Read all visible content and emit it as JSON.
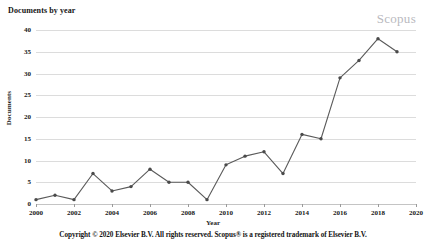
{
  "header": {
    "title": "Documents by year",
    "watermark": "Scopus"
  },
  "footer": {
    "copyright": "Copyright © 2020 Elsevier B.V. All rights reserved. Scopus® is a registered trademark of Elsevier B.V."
  },
  "chart_data": {
    "type": "line",
    "title": "Documents by year",
    "xlabel": "Year",
    "ylabel": "Documents",
    "x": [
      2000,
      2001,
      2002,
      2003,
      2004,
      2005,
      2006,
      2007,
      2008,
      2009,
      2010,
      2011,
      2012,
      2013,
      2014,
      2015,
      2016,
      2017,
      2018,
      2019
    ],
    "values": [
      1,
      2,
      1,
      7,
      3,
      4,
      8,
      5,
      5,
      1,
      9,
      11,
      12,
      7,
      16,
      15,
      29,
      33,
      38,
      35
    ],
    "xlim": [
      2000,
      2020
    ],
    "ylim": [
      0,
      40
    ],
    "ytick_values": [
      0,
      5,
      10,
      15,
      20,
      25,
      30,
      35,
      40
    ],
    "ytick_labels": [
      "0",
      "5",
      "10",
      "15",
      "20",
      "25",
      "30",
      "35",
      "40"
    ],
    "xtick_values": [
      2000,
      2002,
      2004,
      2006,
      2008,
      2010,
      2012,
      2014,
      2016,
      2018,
      2020
    ],
    "xtick_labels": [
      "2000",
      "2002",
      "2004",
      "2006",
      "2008",
      "2010",
      "2012",
      "2014",
      "2016",
      "2018",
      "2020"
    ],
    "grid": "horizontal",
    "legend": "none",
    "series_color": "#5a5a5a",
    "marker_color": "#4a4a4a",
    "gridline_color": "#dcdcdc"
  }
}
